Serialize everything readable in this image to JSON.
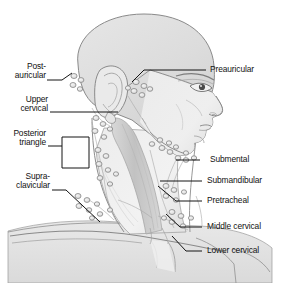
{
  "figure": {
    "view": "right lateral profile",
    "style": "grayscale medical line illustration",
    "colors": {
      "background": "#ffffff",
      "skin_fill": "#ebebeb",
      "scalp_fill": "#e2e2e2",
      "shadow_fill": "#d4d4d4",
      "muscle_fill": "#c9c9c9",
      "node_fill": "#e8e8e8",
      "outline": "#8a8a8a",
      "leader_line": "#1a1a1a",
      "text": "#111111"
    }
  },
  "labels_left": [
    {
      "id": "post-auricular",
      "lines": [
        "Post-",
        "auricular"
      ],
      "text": "Post-auricular",
      "x": 2,
      "y": 63,
      "leader": "angled-up-right"
    },
    {
      "id": "upper-cervical",
      "lines": [
        "Upper",
        "cervical"
      ],
      "text": "Upper cervical",
      "x": 2,
      "y": 97,
      "leader": "horizontal"
    },
    {
      "id": "posterior-triangle",
      "lines": [
        "Posterior",
        "triangle"
      ],
      "text": "Posterior triangle",
      "x": 2,
      "y": 130,
      "leader": "bracket"
    },
    {
      "id": "supra-clavicular",
      "lines": [
        "Supra-",
        "clavicular"
      ],
      "text": "Supra-clavicular",
      "x": 2,
      "y": 172,
      "leader": "angled-down-right"
    }
  ],
  "labels_right": [
    {
      "id": "preauricular",
      "text": "Preauricular",
      "x": 210,
      "y": 61,
      "leader": "horizontal-then-angled-down-left"
    },
    {
      "id": "submental",
      "text": "Submental",
      "x": 210,
      "y": 156,
      "leader": "horizontal"
    },
    {
      "id": "submandibular",
      "text": "Submandibular",
      "x": 210,
      "y": 178,
      "leader": "horizontal"
    },
    {
      "id": "pretracheal",
      "text": "Pretracheal",
      "x": 210,
      "y": 198,
      "leader": "angled-up-left"
    },
    {
      "id": "middle-cervical",
      "text": "Middle cervical",
      "x": 210,
      "y": 224,
      "leader": "angled-up-left"
    },
    {
      "id": "lower-cervical",
      "text": "Lower cervical",
      "x": 210,
      "y": 248,
      "leader": "angled-up-left"
    }
  ],
  "node_clusters": [
    {
      "region": "post-auricular",
      "count": 4
    },
    {
      "region": "preauricular",
      "count": 6
    },
    {
      "region": "upper-cervical",
      "count": 5
    },
    {
      "region": "posterior-triangle",
      "count": 7
    },
    {
      "region": "supraclavicular",
      "count": 8
    },
    {
      "region": "submental",
      "count": 4
    },
    {
      "region": "submandibular",
      "count": 6
    },
    {
      "region": "middle-cervical",
      "count": 5
    },
    {
      "region": "lower-cervical",
      "count": 6
    }
  ]
}
